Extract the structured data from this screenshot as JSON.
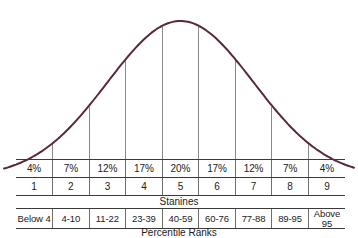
{
  "figure": {
    "title": "",
    "curve_color": "#5a2838",
    "rule_color": "#3a3a3a",
    "gridline_color": "#8a8a8a",
    "text_color": "#1b1b1b"
  },
  "axis_captions": {
    "stanines": "Stanines",
    "percentile_ranks": "Percentile Ranks"
  },
  "chart_data": {
    "type": "area",
    "title": "",
    "subtitle": "",
    "xlabel": "Stanines",
    "ylabel": "",
    "grid": true,
    "legend_position": "none",
    "categories": [
      "1",
      "2",
      "3",
      "4",
      "5",
      "6",
      "7",
      "8",
      "9"
    ],
    "series": [
      {
        "name": "Percent of cases",
        "values": [
          4,
          7,
          12,
          17,
          20,
          17,
          12,
          7,
          4
        ],
        "value_labels": [
          "4%",
          "7%",
          "12%",
          "17%",
          "20%",
          "17%",
          "12%",
          "7%",
          "4%"
        ]
      }
    ],
    "percentile_ranks": [
      "Below 4",
      "4-10",
      "11-22",
      "23-39",
      "40-59",
      "60-76",
      "77-88",
      "89-95",
      "Above 95"
    ],
    "annotations": [
      "Normal bell curve overlaid across the nine stanine bands",
      "Vertical gridlines separate each stanine band"
    ],
    "curve": {
      "distribution": "normal",
      "mean_stanine": 5,
      "sd_stanines": 2
    }
  },
  "table": {
    "percent_row": {
      "name": "percent-of-cases",
      "cells": [
        "4%",
        "7%",
        "12%",
        "17%",
        "20%",
        "17%",
        "12%",
        "7%",
        "4%"
      ]
    },
    "stanine_row": {
      "name": "stanine-number",
      "cells": [
        "1",
        "2",
        "3",
        "4",
        "5",
        "6",
        "7",
        "8",
        "9"
      ]
    },
    "percentile_row": {
      "name": "percentile-rank",
      "cells": [
        "Below 4",
        "4-10",
        "11-22",
        "23-39",
        "40-59",
        "60-76",
        "77-88",
        "89-95",
        "Above 95"
      ]
    }
  }
}
